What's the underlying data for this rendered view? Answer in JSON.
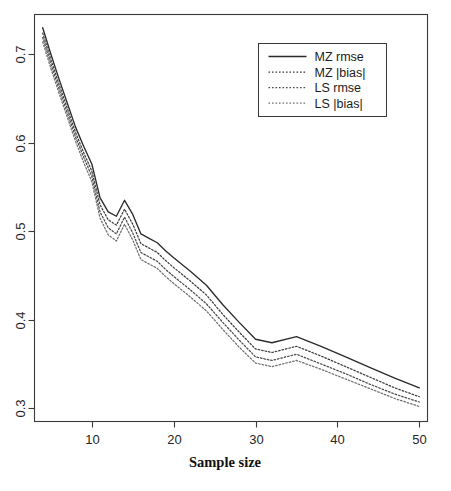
{
  "chart_data": {
    "type": "line",
    "title": "",
    "xlabel": "Sample size",
    "ylabel": "",
    "xlim": [
      3,
      51
    ],
    "ylim": [
      0.285,
      0.745
    ],
    "grid": false,
    "legend_position": "top-right",
    "xticks": [
      10,
      20,
      30,
      40,
      50
    ],
    "xtick_labels": [
      "10",
      "20",
      "30",
      "40",
      "50"
    ],
    "yticks": [
      0.3,
      0.4,
      0.5,
      0.6,
      0.7
    ],
    "ytick_labels": [
      "0.3",
      "0.4",
      "0.5",
      "0.6",
      "0.7"
    ],
    "x": [
      4,
      5,
      6,
      7,
      8,
      9,
      10,
      11,
      12,
      13,
      14,
      15,
      16,
      17,
      18,
      19,
      20,
      22,
      24,
      26,
      28,
      30,
      32,
      35,
      38,
      41,
      44,
      47,
      50
    ],
    "series": [
      {
        "name": "MZ rmse",
        "style": "solid",
        "color": "#2b2b2b",
        "values": [
          0.73,
          0.7,
          0.672,
          0.645,
          0.618,
          0.596,
          0.576,
          0.538,
          0.522,
          0.517,
          0.535,
          0.519,
          0.497,
          0.492,
          0.487,
          0.478,
          0.47,
          0.455,
          0.439,
          0.417,
          0.397,
          0.378,
          0.374,
          0.381,
          0.37,
          0.358,
          0.346,
          0.334,
          0.323
        ]
      },
      {
        "name": "MZ |bias|",
        "style": "dotted",
        "color": "#3d3d3d",
        "values": [
          0.724,
          0.694,
          0.666,
          0.639,
          0.612,
          0.589,
          0.568,
          0.53,
          0.513,
          0.507,
          0.525,
          0.508,
          0.486,
          0.481,
          0.476,
          0.467,
          0.459,
          0.444,
          0.428,
          0.406,
          0.386,
          0.367,
          0.363,
          0.37,
          0.359,
          0.347,
          0.335,
          0.323,
          0.313
        ]
      },
      {
        "name": "LS rmse",
        "style": "dotted",
        "color": "#4a4a4a",
        "values": [
          0.719,
          0.689,
          0.661,
          0.634,
          0.607,
          0.584,
          0.562,
          0.522,
          0.504,
          0.497,
          0.516,
          0.498,
          0.476,
          0.471,
          0.466,
          0.457,
          0.449,
          0.434,
          0.418,
          0.397,
          0.377,
          0.358,
          0.354,
          0.361,
          0.35,
          0.339,
          0.327,
          0.316,
          0.307
        ]
      },
      {
        "name": "LS |bias|",
        "style": "dotted",
        "color": "#707070",
        "values": [
          0.714,
          0.684,
          0.656,
          0.629,
          0.602,
          0.578,
          0.556,
          0.515,
          0.496,
          0.489,
          0.508,
          0.49,
          0.468,
          0.463,
          0.458,
          0.449,
          0.441,
          0.426,
          0.41,
          0.389,
          0.369,
          0.351,
          0.347,
          0.354,
          0.344,
          0.333,
          0.322,
          0.311,
          0.302
        ]
      }
    ]
  },
  "legend": {
    "entries": [
      {
        "label": "MZ rmse"
      },
      {
        "label": "MZ |bias|"
      },
      {
        "label": "LS rmse"
      },
      {
        "label": "LS |bias|"
      }
    ]
  },
  "caption": {
    "text": ""
  }
}
